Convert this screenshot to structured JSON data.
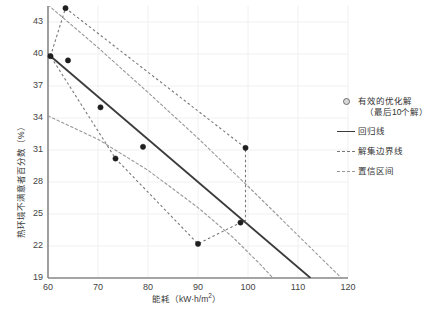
{
  "chart_data": {
    "type": "scatter",
    "title": "",
    "xlabel": "能耗（kW·h/m²）",
    "ylabel": "热环境不满意者百分数（%）",
    "xlim": [
      60,
      120
    ],
    "ylim": [
      19,
      44.5
    ],
    "xticks": [
      60,
      70,
      80,
      90,
      100,
      110,
      120
    ],
    "yticks": [
      19,
      22,
      25,
      28,
      31,
      34,
      37,
      40,
      43
    ],
    "grid": true,
    "legend_position": "right",
    "series": [
      {
        "name": "有效的优化解（最后10个解）",
        "type": "scatter",
        "marker": "circle",
        "points": [
          {
            "x": 60.5,
            "y": 39.8
          },
          {
            "x": 63.5,
            "y": 44.3
          },
          {
            "x": 64.0,
            "y": 39.4
          },
          {
            "x": 70.5,
            "y": 35.0
          },
          {
            "x": 73.5,
            "y": 30.2
          },
          {
            "x": 79.0,
            "y": 31.3
          },
          {
            "x": 90.0,
            "y": 22.2
          },
          {
            "x": 98.5,
            "y": 24.2
          },
          {
            "x": 99.5,
            "y": 31.2
          }
        ]
      },
      {
        "name": "回归线",
        "type": "line",
        "style": "solid",
        "points": [
          {
            "x": 60.0,
            "y": 40.0
          },
          {
            "x": 112.5,
            "y": 19.0
          }
        ]
      },
      {
        "name": "解集边界线",
        "type": "polygon",
        "style": "dashed",
        "points": [
          {
            "x": 60.5,
            "y": 39.8
          },
          {
            "x": 63.5,
            "y": 44.3
          },
          {
            "x": 99.5,
            "y": 31.2
          },
          {
            "x": 99.5,
            "y": 24.4
          },
          {
            "x": 98.5,
            "y": 24.2
          },
          {
            "x": 90.0,
            "y": 22.2
          },
          {
            "x": 73.5,
            "y": 30.2
          },
          {
            "x": 60.5,
            "y": 39.8
          }
        ]
      },
      {
        "name": "置信区间",
        "type": "band",
        "style": "dashdot",
        "upper": [
          {
            "x": 60.0,
            "y": 44.6
          },
          {
            "x": 70.0,
            "y": 40.6
          },
          {
            "x": 80.0,
            "y": 36.4
          },
          {
            "x": 90.0,
            "y": 32.1
          },
          {
            "x": 100.0,
            "y": 27.6
          },
          {
            "x": 110.0,
            "y": 23.0
          },
          {
            "x": 120.0,
            "y": 18.4
          }
        ],
        "lower": [
          {
            "x": 60.0,
            "y": 34.2
          },
          {
            "x": 70.0,
            "y": 32.0
          },
          {
            "x": 80.0,
            "y": 29.1
          },
          {
            "x": 90.0,
            "y": 25.6
          },
          {
            "x": 97.0,
            "y": 22.8
          },
          {
            "x": 102.0,
            "y": 20.5
          },
          {
            "x": 105.0,
            "y": 19.0
          }
        ]
      }
    ]
  },
  "axes": {
    "x_title": "能耗（kW·h/m",
    "x_title_sup": "2",
    "x_title_tail": "）",
    "y_title": "热环境不满意者百分数（%）"
  },
  "legend": {
    "items": [
      {
        "key": "circle",
        "label": "有效的优化解",
        "sub": "（最后10个解）"
      },
      {
        "key": "solid",
        "label": "回归线",
        "sub": ""
      },
      {
        "key": "dash",
        "label": "解集边界线",
        "sub": ""
      },
      {
        "key": "dashdot",
        "label": "置信区间",
        "sub": ""
      }
    ]
  },
  "colors": {
    "background": "#ffffff",
    "grid": "#f0f0f0",
    "axis": "#888888",
    "regression": "#3b3b3b",
    "boundary": "#777777",
    "confidence": "#999999",
    "marker_fill": "#1f1f1f",
    "text": "#444444"
  }
}
